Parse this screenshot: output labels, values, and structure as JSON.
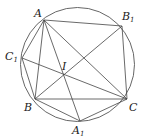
{
  "diagram": {
    "type": "geometry",
    "circle": {
      "cx": 77.5,
      "cy": 64.5,
      "r": 57
    },
    "points": [
      {
        "id": "A",
        "label": "A",
        "sub": "",
        "x": 44,
        "y": 20,
        "lx": 34,
        "ly": 17
      },
      {
        "id": "B1",
        "label": "B",
        "sub": "1",
        "x": 122,
        "y": 26,
        "lx": 122,
        "ly": 20
      },
      {
        "id": "C1",
        "label": "C",
        "sub": "1",
        "x": 22,
        "y": 58,
        "lx": 5,
        "ly": 60
      },
      {
        "id": "I",
        "label": "I",
        "sub": "",
        "x": 63,
        "y": 75,
        "lx": 62,
        "ly": 70
      },
      {
        "id": "B",
        "label": "B",
        "sub": "",
        "x": 35,
        "y": 99,
        "lx": 24,
        "ly": 111
      },
      {
        "id": "C",
        "label": "C",
        "sub": "",
        "x": 127,
        "y": 99,
        "lx": 129,
        "ly": 111
      },
      {
        "id": "A1",
        "label": "A",
        "sub": "1",
        "x": 80,
        "y": 121,
        "lx": 72,
        "ly": 134
      }
    ],
    "segments": [
      [
        "A",
        "B1"
      ],
      [
        "A",
        "C1"
      ],
      [
        "A",
        "B"
      ],
      [
        "A",
        "C"
      ],
      [
        "A",
        "A1"
      ],
      [
        "B1",
        "C"
      ],
      [
        "B1",
        "B"
      ],
      [
        "C1",
        "B"
      ],
      [
        "C1",
        "C"
      ],
      [
        "B",
        "C"
      ],
      [
        "B",
        "A1"
      ],
      [
        "C",
        "A1"
      ]
    ]
  }
}
